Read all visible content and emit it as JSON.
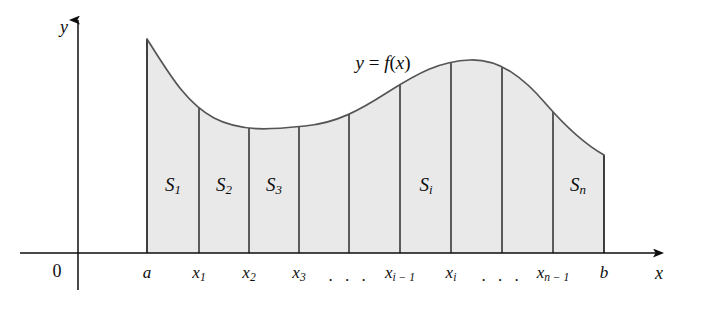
{
  "figure": {
    "background_color": "#ffffff",
    "region_fill_color": "#e9e9e9",
    "stroke_color": "#4a4a4a",
    "axis_color": "#0d0d0d",
    "text_color": "#0d0d0d"
  },
  "axes": {
    "y_axis_label": "y",
    "x_axis_label": "x",
    "origin_label": "0"
  },
  "curve": {
    "label_y": "y",
    "label_equals": " = ",
    "label_f": "f",
    "label_paren_open": "(",
    "label_x": "x",
    "label_paren_close": ")",
    "label_full": "y = f(x)"
  },
  "tick_labels": [
    {
      "name": "a",
      "base": "a",
      "sub": "",
      "x": 147
    },
    {
      "name": "x1",
      "base": "x",
      "sub": "1",
      "x": 199
    },
    {
      "name": "x2",
      "base": "x",
      "sub": "2",
      "x": 249
    },
    {
      "name": "x3",
      "base": "x",
      "sub": "3",
      "x": 299
    },
    {
      "name": "xi-1",
      "base": "x",
      "sub": "i − 1",
      "x": 400
    },
    {
      "name": "xi",
      "base": "x",
      "sub": "i",
      "x": 451
    },
    {
      "name": "xn-1",
      "base": "x",
      "sub": "n − 1",
      "x": 553
    },
    {
      "name": "b",
      "base": "b",
      "sub": "",
      "x": 604
    }
  ],
  "ellipses": [
    {
      "name": "ellipsis-left",
      "text": ". . .",
      "x": 349
    },
    {
      "name": "ellipsis-right",
      "text": ". . .",
      "x": 502
    }
  ],
  "region_labels": [
    {
      "name": "S1",
      "base": "S",
      "sub": "1",
      "x": 173,
      "y": 186
    },
    {
      "name": "S2",
      "base": "S",
      "sub": "2",
      "x": 224,
      "y": 186
    },
    {
      "name": "S3",
      "base": "S",
      "sub": "3",
      "x": 274,
      "y": 186
    },
    {
      "name": "Si",
      "base": "S",
      "sub": "i",
      "x": 426,
      "y": 186
    },
    {
      "name": "Sn",
      "base": "S",
      "sub": "n",
      "x": 578,
      "y": 186
    }
  ],
  "geometry": {
    "x_axis_y": 253,
    "y_axis_x": 78,
    "y_axis_top": 20,
    "y_axis_bottom": 290,
    "x_axis_left": 20,
    "x_axis_right": 662,
    "region_left": 147,
    "region_right": 604,
    "divider_x_positions": [
      147,
      199,
      249,
      299,
      349,
      400,
      451,
      502,
      553,
      604
    ],
    "curve_path": "M 147 39 C 170 75, 186 103, 214 118 C 243 133, 276 129, 305 126 C 337 123, 360 110, 388 92 C 418 73, 440 61, 470 60 C 500 59, 524 78, 546 104 C 566 127, 588 146, 604 155",
    "curve_start": {
      "x": 147,
      "y": 39
    },
    "curve_end": {
      "x": 604,
      "y": 155
    }
  },
  "curve_label_position": {
    "x": 383,
    "y": 62
  },
  "axis_label_positions": {
    "y": {
      "x": 64,
      "y": 27
    },
    "x": {
      "x": 659,
      "y": 273
    },
    "origin": {
      "x": 57,
      "y": 271
    }
  }
}
